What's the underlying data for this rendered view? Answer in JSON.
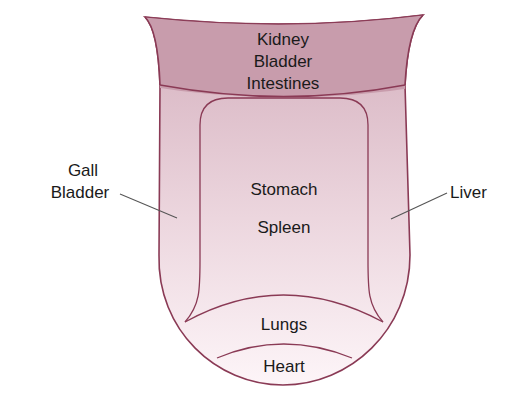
{
  "diagram": {
    "colors": {
      "outline": "#8a3a55",
      "root_fill": "#c69aaa",
      "body_fill_top": "#d9b6c3",
      "body_fill_bottom": "#fbf1f4",
      "leader": "#555555",
      "text": "#1a1a1a"
    },
    "regions": {
      "root": {
        "lines": [
          "Kidney",
          "Bladder",
          "Intestines"
        ]
      },
      "center": {
        "lines": [
          "Stomach",
          "Spleen"
        ]
      },
      "left_side": {
        "lines": [
          "Gall",
          "Bladder"
        ]
      },
      "right_side": {
        "lines": [
          "Liver"
        ]
      },
      "front": {
        "lines": [
          "Lungs"
        ]
      },
      "tip": {
        "lines": [
          "Heart"
        ]
      }
    }
  }
}
